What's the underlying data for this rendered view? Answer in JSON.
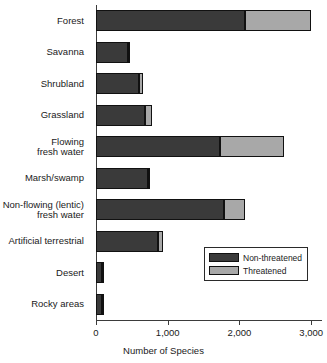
{
  "chart_data": {
    "type": "bar",
    "orientation": "horizontal",
    "stacked": true,
    "title": "",
    "xlabel": "Number of Species",
    "ylabel": "",
    "xlim": [
      0,
      3150
    ],
    "xticks": [
      0,
      1000,
      2000,
      3000
    ],
    "xtick_labels": [
      "0",
      "1,000",
      "2,000",
      "3,000"
    ],
    "grid": false,
    "legend_position": "lower-right",
    "categories": [
      "Forest",
      "Savanna",
      "Shrubland",
      "Grassland",
      "Flowing\nfresh water",
      "Marsh/swamp",
      "Non-flowing (lentic)\nfresh water",
      "Artificial terrestrial",
      "Desert",
      "Rocky areas"
    ],
    "series": [
      {
        "name": "Non-threatened",
        "color": "#3a3a3a",
        "values": [
          2070,
          450,
          600,
          680,
          1730,
          730,
          1790,
          870,
          80,
          85
        ]
      },
      {
        "name": "Threatened",
        "color": "#a8a8a8",
        "values": [
          930,
          20,
          50,
          100,
          890,
          20,
          280,
          60,
          20,
          25
        ]
      }
    ],
    "totals": [
      3000,
      470,
      650,
      780,
      2620,
      750,
      2070,
      930,
      100,
      110
    ]
  },
  "legend": {
    "items": [
      {
        "label": "Non-threatened",
        "swatch": "dark"
      },
      {
        "label": "Threatened",
        "swatch": "light"
      }
    ]
  }
}
